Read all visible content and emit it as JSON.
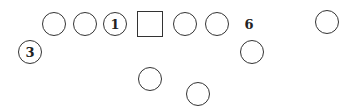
{
  "diagram": {
    "type": "formation",
    "stroke_color": "#333333",
    "shapes": [
      {
        "id": "c1",
        "kind": "circle",
        "cx": 54,
        "cy": 24,
        "r": 12,
        "label": ""
      },
      {
        "id": "c2",
        "kind": "circle",
        "cx": 85,
        "cy": 24,
        "r": 12,
        "label": ""
      },
      {
        "id": "c3",
        "kind": "circle",
        "cx": 115,
        "cy": 24,
        "r": 12,
        "label": "1"
      },
      {
        "id": "sq",
        "kind": "square",
        "cx": 150,
        "cy": 24,
        "r": 13,
        "label": ""
      },
      {
        "id": "c4",
        "kind": "circle",
        "cx": 185,
        "cy": 24,
        "r": 12,
        "label": ""
      },
      {
        "id": "c5",
        "kind": "circle",
        "cx": 217,
        "cy": 24,
        "r": 12,
        "label": ""
      },
      {
        "id": "c6",
        "kind": "circle",
        "cx": 327,
        "cy": 22,
        "r": 12,
        "label": ""
      },
      {
        "id": "c7",
        "kind": "circle",
        "cx": 30,
        "cy": 52,
        "r": 12,
        "label": "3"
      },
      {
        "id": "c8",
        "kind": "circle",
        "cx": 252,
        "cy": 52,
        "r": 12,
        "label": ""
      },
      {
        "id": "c9",
        "kind": "circle",
        "cx": 150,
        "cy": 79,
        "r": 12,
        "label": ""
      },
      {
        "id": "c10",
        "kind": "circle",
        "cx": 198,
        "cy": 94,
        "r": 12,
        "label": ""
      }
    ],
    "free_labels": [
      {
        "id": "l6",
        "text": "6",
        "x": 249,
        "y": 24
      }
    ]
  }
}
